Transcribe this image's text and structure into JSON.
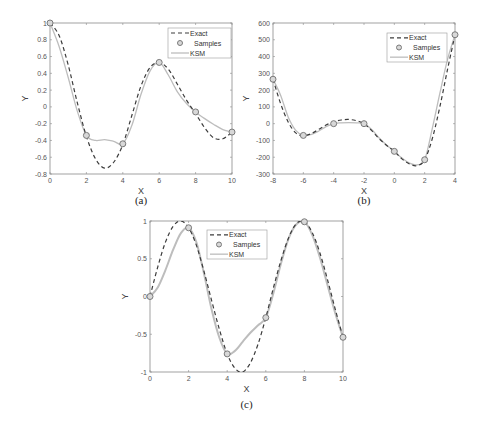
{
  "chart_data": [
    {
      "type": "line",
      "caption": "(a)",
      "xlabel": "X",
      "ylabel": "Y",
      "xlim": [
        0,
        10
      ],
      "ylim": [
        -0.8,
        1
      ],
      "xticks": [
        0,
        2,
        4,
        6,
        8,
        10
      ],
      "xtick_labels": [
        "0",
        "2",
        "4",
        "6",
        "8",
        "10"
      ],
      "yticks": [
        -0.8,
        -0.6,
        -0.4,
        -0.2,
        0,
        0.2,
        0.4,
        0.6,
        0.8,
        1
      ],
      "ytick_labels": [
        "-0.8",
        "-0.6",
        "-0.4",
        "-0.2",
        "0",
        "0.2",
        "0.4",
        "0.6",
        "0.8",
        "1"
      ],
      "legend": {
        "placement": "top-right",
        "entries": [
          "Exact",
          "Samples",
          "KSM"
        ]
      },
      "series": [
        {
          "name": "Exact",
          "style": "dashed",
          "x": [
            0,
            0.5,
            1,
            1.5,
            2,
            2.5,
            3,
            3.5,
            4,
            4.5,
            5,
            5.5,
            6,
            6.5,
            7,
            7.5,
            8,
            8.5,
            9,
            9.5,
            10
          ],
          "y": [
            1,
            0.85,
            0.5,
            0.05,
            -0.35,
            -0.62,
            -0.73,
            -0.66,
            -0.45,
            -0.1,
            0.25,
            0.47,
            0.53,
            0.45,
            0.27,
            0.08,
            -0.08,
            -0.25,
            -0.37,
            -0.38,
            -0.3
          ]
        },
        {
          "name": "Samples",
          "style": "markers",
          "x": [
            0,
            2,
            4,
            6,
            8,
            10
          ],
          "y": [
            1,
            -0.34,
            -0.44,
            0.53,
            -0.06,
            -0.3
          ]
        },
        {
          "name": "KSM",
          "style": "solid",
          "x": [
            0,
            0.5,
            1,
            1.5,
            2,
            2.5,
            3,
            3.5,
            4,
            4.5,
            5,
            5.5,
            6,
            6.5,
            7,
            7.5,
            8,
            8.5,
            9,
            9.5,
            10
          ],
          "y": [
            1,
            0.72,
            0.35,
            -0.05,
            -0.34,
            -0.4,
            -0.39,
            -0.41,
            -0.44,
            -0.22,
            0.15,
            0.43,
            0.53,
            0.38,
            0.18,
            0.04,
            -0.06,
            -0.14,
            -0.21,
            -0.27,
            -0.3
          ]
        }
      ]
    },
    {
      "type": "line",
      "caption": "(b)",
      "xlabel": "X",
      "ylabel": "Y",
      "xlim": [
        -8,
        4
      ],
      "ylim": [
        -300,
        600
      ],
      "xticks": [
        -8,
        -6,
        -4,
        -2,
        0,
        2,
        4
      ],
      "xtick_labels": [
        "-8",
        "-6",
        "-4",
        "-2",
        "0",
        "2",
        "4"
      ],
      "yticks": [
        -300,
        -200,
        -100,
        0,
        100,
        200,
        300,
        400,
        500,
        600
      ],
      "ytick_labels": [
        "-300",
        "-200",
        "-100",
        "0",
        "100",
        "200",
        "300",
        "400",
        "500",
        "600"
      ],
      "legend": {
        "placement": "top-right",
        "entries": [
          "Exact",
          "Samples",
          "KSM"
        ]
      },
      "series": [
        {
          "name": "Exact",
          "style": "dashed",
          "x": [
            -8,
            -7.5,
            -7,
            -6.5,
            -6,
            -5.5,
            -5,
            -4.5,
            -4,
            -3.5,
            -3,
            -2.5,
            -2,
            -1.5,
            -1,
            -0.5,
            0,
            0.5,
            1,
            1.5,
            2,
            2.5,
            3,
            3.5,
            4
          ],
          "y": [
            265,
            120,
            10,
            -55,
            -72,
            -60,
            -35,
            -8,
            10,
            22,
            25,
            18,
            0,
            -40,
            -90,
            -130,
            -165,
            -210,
            -240,
            -250,
            -215,
            -90,
            100,
            320,
            530
          ]
        },
        {
          "name": "Samples",
          "style": "markers",
          "x": [
            -8,
            -6,
            -4,
            -2,
            0,
            2,
            4
          ],
          "y": [
            265,
            -70,
            0,
            0,
            -165,
            -215,
            530
          ]
        },
        {
          "name": "KSM",
          "style": "solid",
          "x": [
            -8,
            -7.5,
            -7,
            -6.5,
            -6,
            -5.5,
            -5,
            -4.5,
            -4,
            -3.5,
            -3,
            -2.5,
            -2,
            -1.5,
            -1,
            -0.5,
            0,
            0.5,
            1,
            1.5,
            2,
            2.5,
            3,
            3.5,
            4
          ],
          "y": [
            265,
            170,
            40,
            -40,
            -70,
            -65,
            -45,
            -18,
            0,
            5,
            6,
            5,
            0,
            -35,
            -85,
            -128,
            -165,
            -205,
            -235,
            -245,
            -215,
            -30,
            180,
            380,
            530
          ]
        }
      ]
    },
    {
      "type": "line",
      "caption": "(c)",
      "xlabel": "X",
      "ylabel": "Y",
      "xlim": [
        0,
        10
      ],
      "ylim": [
        -1,
        1
      ],
      "xticks": [
        0,
        2,
        4,
        6,
        8,
        10
      ],
      "xtick_labels": [
        "0",
        "2",
        "4",
        "6",
        "8",
        "10"
      ],
      "yticks": [
        -1,
        -0.5,
        0,
        0.5,
        1
      ],
      "ytick_labels": [
        "-1",
        "-0.5",
        "0",
        "0.5",
        "1"
      ],
      "legend": {
        "placement": "top-center",
        "entries": [
          "Exact",
          "Samples",
          "KSM"
        ]
      },
      "series": [
        {
          "name": "Exact",
          "style": "dashed",
          "x": [
            0,
            0.4,
            0.8,
            1.2,
            1.6,
            2,
            2.4,
            2.8,
            3.2,
            3.6,
            4,
            4.4,
            4.8,
            5.2,
            5.6,
            6,
            6.4,
            6.8,
            7.2,
            7.6,
            8,
            8.4,
            8.8,
            9.2,
            9.6,
            10
          ],
          "y": [
            0,
            0.39,
            0.72,
            0.93,
            1.0,
            0.91,
            0.68,
            0.33,
            -0.06,
            -0.44,
            -0.76,
            -0.95,
            -1.0,
            -0.88,
            -0.63,
            -0.28,
            0.12,
            0.49,
            0.79,
            0.97,
            0.99,
            0.85,
            0.58,
            0.22,
            -0.17,
            -0.54
          ]
        },
        {
          "name": "Samples",
          "style": "markers",
          "x": [
            0,
            2,
            4,
            6,
            8,
            10
          ],
          "y": [
            0,
            0.91,
            -0.76,
            -0.28,
            0.99,
            -0.54
          ]
        },
        {
          "name": "KSM",
          "style": "solid",
          "x": [
            0,
            0.4,
            0.8,
            1.2,
            1.6,
            2,
            2.4,
            2.8,
            3.2,
            3.6,
            4,
            4.4,
            4.8,
            5.2,
            5.6,
            6,
            6.4,
            6.8,
            7.2,
            7.6,
            8,
            8.4,
            8.8,
            9.2,
            9.6,
            10
          ],
          "y": [
            0,
            0.12,
            0.35,
            0.62,
            0.84,
            0.91,
            0.72,
            0.3,
            -0.18,
            -0.55,
            -0.76,
            -0.72,
            -0.6,
            -0.48,
            -0.38,
            -0.28,
            0.05,
            0.45,
            0.78,
            0.96,
            0.99,
            0.82,
            0.52,
            0.15,
            -0.22,
            -0.54
          ]
        }
      ]
    }
  ]
}
